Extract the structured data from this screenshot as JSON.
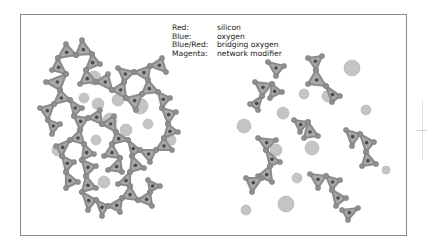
{
  "legend": {
    "rows": [
      {
        "key": "Red:",
        "value": "silicon"
      },
      {
        "key": "Blue:",
        "value": "oxygen"
      },
      {
        "key": "Blue/Red:",
        "value": "bridging oxygen"
      },
      {
        "key": "Magenta:",
        "value": "network modifier"
      }
    ]
  },
  "colors": {
    "frame": "#8a8a8a",
    "tetra_fill": "#a9a9a9",
    "tetra_stroke": "#8c8c8c",
    "silicon": "#4a4a4a",
    "oxygen": "#8f8f8f",
    "modifier": "#c4c4c4",
    "modifier_stroke": "#b2b2b2"
  },
  "left_network": {
    "tetrahedra": [
      [
        [
          66,
          44
        ],
        [
          58,
          58
        ],
        [
          76,
          55
        ]
      ],
      [
        [
          76,
          55
        ],
        [
          82,
          40
        ],
        [
          92,
          54
        ]
      ],
      [
        [
          92,
          54
        ],
        [
          100,
          64
        ],
        [
          86,
          70
        ]
      ],
      [
        [
          58,
          58
        ],
        [
          52,
          70
        ],
        [
          66,
          74
        ]
      ],
      [
        [
          66,
          74
        ],
        [
          46,
          82
        ],
        [
          60,
          90
        ]
      ],
      [
        [
          60,
          90
        ],
        [
          70,
          100
        ],
        [
          54,
          104
        ]
      ],
      [
        [
          86,
          70
        ],
        [
          80,
          84
        ],
        [
          96,
          82
        ]
      ],
      [
        [
          96,
          82
        ],
        [
          108,
          74
        ],
        [
          112,
          90
        ]
      ],
      [
        [
          112,
          90
        ],
        [
          124,
          82
        ],
        [
          126,
          98
        ]
      ],
      [
        [
          126,
          98
        ],
        [
          142,
          94
        ],
        [
          136,
          110
        ]
      ],
      [
        [
          142,
          94
        ],
        [
          148,
          80
        ],
        [
          158,
          92
        ]
      ],
      [
        [
          148,
          80
        ],
        [
          134,
          72
        ],
        [
          150,
          66
        ]
      ],
      [
        [
          150,
          66
        ],
        [
          162,
          58
        ],
        [
          166,
          72
        ]
      ],
      [
        [
          124,
          82
        ],
        [
          118,
          68
        ],
        [
          134,
          72
        ]
      ],
      [
        [
          158,
          92
        ],
        [
          170,
          98
        ],
        [
          162,
          108
        ]
      ],
      [
        [
          162,
          108
        ],
        [
          176,
          112
        ],
        [
          168,
          124
        ]
      ],
      [
        [
          168,
          124
        ],
        [
          178,
          132
        ],
        [
          164,
          138
        ]
      ],
      [
        [
          164,
          138
        ],
        [
          172,
          150
        ],
        [
          156,
          150
        ]
      ],
      [
        [
          156,
          150
        ],
        [
          150,
          162
        ],
        [
          140,
          150
        ]
      ],
      [
        [
          140,
          150
        ],
        [
          128,
          140
        ],
        [
          132,
          156
        ]
      ],
      [
        [
          54,
          104
        ],
        [
          40,
          108
        ],
        [
          48,
          120
        ]
      ],
      [
        [
          48,
          120
        ],
        [
          60,
          124
        ],
        [
          52,
          134
        ]
      ],
      [
        [
          70,
          100
        ],
        [
          82,
          108
        ],
        [
          74,
          116
        ]
      ],
      [
        [
          74,
          116
        ],
        [
          88,
          118
        ],
        [
          80,
          130
        ]
      ],
      [
        [
          88,
          118
        ],
        [
          100,
          110
        ],
        [
          102,
          124
        ]
      ],
      [
        [
          102,
          124
        ],
        [
          114,
          116
        ],
        [
          116,
          132
        ]
      ],
      [
        [
          116,
          132
        ],
        [
          128,
          140
        ],
        [
          112,
          144
        ]
      ],
      [
        [
          80,
          130
        ],
        [
          70,
          140
        ],
        [
          84,
          144
        ]
      ],
      [
        [
          70,
          140
        ],
        [
          56,
          146
        ],
        [
          62,
          156
        ]
      ],
      [
        [
          84,
          144
        ],
        [
          94,
          154
        ],
        [
          82,
          160
        ]
      ],
      [
        [
          62,
          156
        ],
        [
          74,
          162
        ],
        [
          66,
          172
        ]
      ],
      [
        [
          82,
          160
        ],
        [
          96,
          166
        ],
        [
          86,
          176
        ]
      ],
      [
        [
          112,
          144
        ],
        [
          104,
          156
        ],
        [
          120,
          158
        ]
      ],
      [
        [
          66,
          172
        ],
        [
          78,
          182
        ],
        [
          66,
          188
        ]
      ],
      [
        [
          86,
          176
        ],
        [
          96,
          188
        ],
        [
          82,
          192
        ]
      ],
      [
        [
          82,
          192
        ],
        [
          96,
          200
        ],
        [
          88,
          210
        ]
      ],
      [
        [
          96,
          200
        ],
        [
          108,
          206
        ],
        [
          102,
          216
        ]
      ],
      [
        [
          108,
          206
        ],
        [
          122,
          198
        ],
        [
          120,
          212
        ]
      ],
      [
        [
          122,
          198
        ],
        [
          130,
          186
        ],
        [
          138,
          200
        ]
      ],
      [
        [
          138,
          200
        ],
        [
          150,
          192
        ],
        [
          152,
          206
        ]
      ],
      [
        [
          150,
          192
        ],
        [
          148,
          180
        ],
        [
          160,
          186
        ]
      ],
      [
        [
          132,
          156
        ],
        [
          144,
          168
        ],
        [
          130,
          172
        ]
      ],
      [
        [
          120,
          158
        ],
        [
          122,
          172
        ],
        [
          108,
          170
        ]
      ],
      [
        [
          130,
          172
        ],
        [
          118,
          184
        ],
        [
          130,
          186
        ]
      ]
    ],
    "modifiers": [
      [
        94,
        78,
        7
      ],
      [
        98,
        104,
        6
      ],
      [
        140,
        106,
        8
      ],
      [
        126,
        130,
        6
      ],
      [
        84,
        98,
        5
      ],
      [
        110,
        120,
        7
      ],
      [
        58,
        150,
        6
      ],
      [
        104,
        182,
        6
      ],
      [
        96,
        140,
        5
      ],
      [
        118,
        100,
        6
      ],
      [
        170,
        140,
        6
      ],
      [
        148,
        124,
        5
      ]
    ]
  },
  "right_network": {
    "tetrahedra": [
      [
        [
          268,
          62
        ],
        [
          284,
          66
        ],
        [
          276,
          76
        ]
      ],
      [
        [
          308,
          58
        ],
        [
          322,
          56
        ],
        [
          316,
          70
        ]
      ],
      [
        [
          316,
          70
        ],
        [
          308,
          84
        ],
        [
          326,
          86
        ]
      ],
      [
        [
          326,
          86
        ],
        [
          340,
          96
        ],
        [
          332,
          102
        ]
      ],
      [
        [
          255,
          82
        ],
        [
          272,
          84
        ],
        [
          262,
          96
        ]
      ],
      [
        [
          262,
          96
        ],
        [
          250,
          104
        ],
        [
          258,
          110
        ]
      ],
      [
        [
          272,
          84
        ],
        [
          282,
          92
        ],
        [
          270,
          98
        ]
      ],
      [
        [
          294,
          120
        ],
        [
          308,
          122
        ],
        [
          300,
          132
        ]
      ],
      [
        [
          308,
          122
        ],
        [
          318,
          136
        ],
        [
          304,
          138
        ]
      ],
      [
        [
          346,
          130
        ],
        [
          360,
          134
        ],
        [
          352,
          146
        ]
      ],
      [
        [
          360,
          134
        ],
        [
          374,
          142
        ],
        [
          366,
          152
        ]
      ],
      [
        [
          366,
          152
        ],
        [
          376,
          164
        ],
        [
          362,
          166
        ]
      ],
      [
        [
          258,
          138
        ],
        [
          276,
          140
        ],
        [
          266,
          150
        ]
      ],
      [
        [
          266,
          150
        ],
        [
          280,
          162
        ],
        [
          270,
          166
        ]
      ],
      [
        [
          270,
          166
        ],
        [
          258,
          176
        ],
        [
          272,
          182
        ]
      ],
      [
        [
          246,
          178
        ],
        [
          262,
          178
        ],
        [
          252,
          192
        ]
      ],
      [
        [
          310,
          174
        ],
        [
          326,
          176
        ],
        [
          318,
          188
        ]
      ],
      [
        [
          326,
          176
        ],
        [
          340,
          180
        ],
        [
          332,
          190
        ]
      ],
      [
        [
          332,
          190
        ],
        [
          346,
          198
        ],
        [
          336,
          206
        ]
      ],
      [
        [
          342,
          210
        ],
        [
          358,
          208
        ],
        [
          348,
          220
        ]
      ]
    ],
    "modifiers": [
      [
        352,
        68,
        8
      ],
      [
        304,
        94,
        5
      ],
      [
        328,
        96,
        6
      ],
      [
        283,
        113,
        6
      ],
      [
        244,
        126,
        7
      ],
      [
        312,
        148,
        7
      ],
      [
        276,
        150,
        6
      ],
      [
        297,
        178,
        5
      ],
      [
        286,
        204,
        8
      ],
      [
        366,
        110,
        5
      ],
      [
        386,
        170,
        4
      ],
      [
        246,
        210,
        5
      ]
    ]
  },
  "side_marks": {
    "line": true,
    "tick": true
  }
}
